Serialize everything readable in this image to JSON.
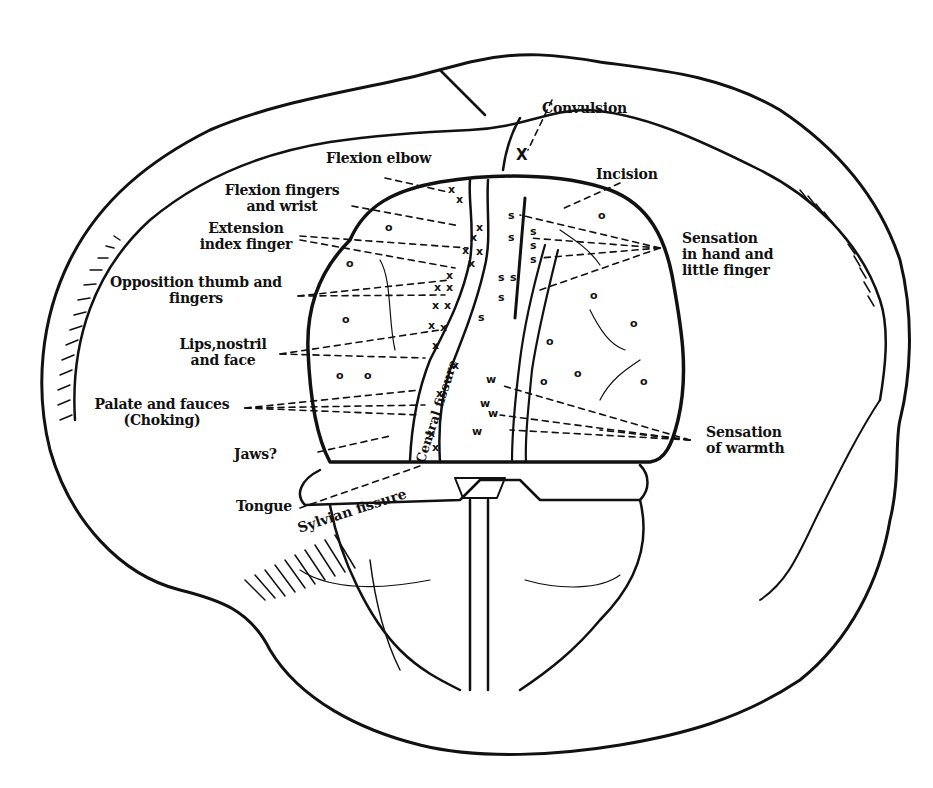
{
  "figure": {
    "colors": {
      "ink": "#111111",
      "paper": "#ffffff"
    }
  },
  "labels": {
    "convulsion": "Convulsion",
    "flexion_elbow": "Flexion elbow",
    "incision": "Incision",
    "flexion_fingers_1": "Flexion fingers",
    "flexion_fingers_2": "and wrist",
    "extension_index_1": "Extension",
    "extension_index_2": "index finger",
    "sensation_hand_1": "Sensation",
    "sensation_hand_2": "in hand and",
    "sensation_hand_3": "little finger",
    "opposition_1": "Opposition thumb and",
    "opposition_2": "fingers",
    "lips_1": "Lips,nostril",
    "lips_2": "and face",
    "palate_1": "Palate and fauces",
    "palate_2": "(Choking)",
    "jaws": "Jaws?",
    "sensation_warmth_1": "Sensation",
    "sensation_warmth_2": "of warmth",
    "tongue": "Tongue",
    "sylvian_fissure": "Sylvian fissure",
    "central_fissure": "Central fissure"
  },
  "markers": {
    "motor": "x",
    "sensory": "s",
    "warmth": "w",
    "negative": "o",
    "convulsion": "X"
  }
}
